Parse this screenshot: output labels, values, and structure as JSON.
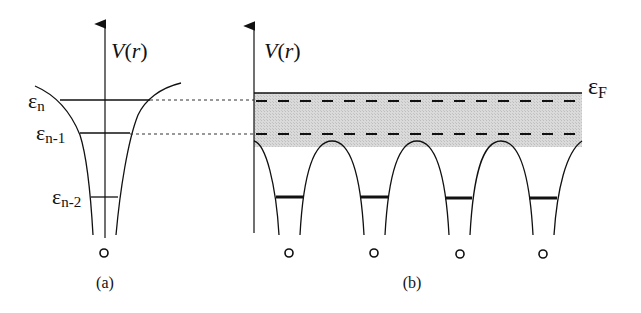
{
  "panel_a": {
    "axis_label_V": "V",
    "axis_label_paren": "(r)",
    "levels": [
      {
        "symbol": "ε",
        "sub": "n"
      },
      {
        "symbol": "ε",
        "sub": "n-1"
      },
      {
        "symbol": "ε",
        "sub": "n-2"
      }
    ],
    "ion_marker": "o",
    "caption": "(a)"
  },
  "panel_b": {
    "axis_label_V": "V",
    "axis_label_paren": "(r)",
    "fermi_symbol": "ε",
    "fermi_sub": "F",
    "ion_count": 4,
    "ion_marker": "o",
    "caption": "(b)"
  },
  "colors": {
    "line": "#111111",
    "band_fill": "#d4d4d4",
    "dotted_guide": "#333333"
  }
}
